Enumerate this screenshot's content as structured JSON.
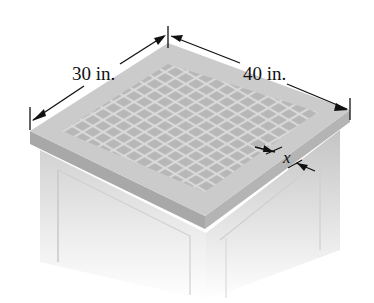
{
  "figure": {
    "labels": {
      "width_label": "30 in.",
      "length_label": "40 in.",
      "border_label": "x"
    },
    "dimensions": {
      "width_in": 30,
      "length_in": 40,
      "border_variable": "x"
    },
    "colors": {
      "surface": "#c9c9c9",
      "tile": "#b3b3b3",
      "grout": "#dcdcdc",
      "edge_left": "#a6a6a6",
      "edge_right": "#b1b1b1",
      "base": "#e6e6e6",
      "line": "#111111"
    }
  }
}
